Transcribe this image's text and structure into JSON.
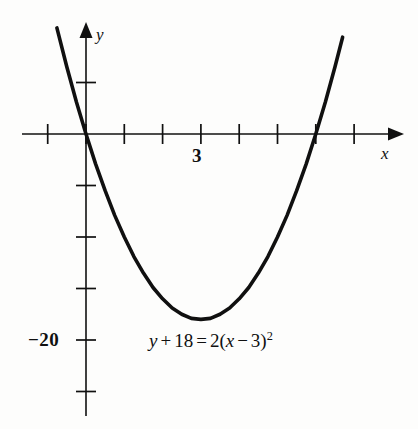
{
  "figure": {
    "background_color": "#fdfdfc",
    "ink_color": "#101010",
    "width": 418,
    "height": 429
  },
  "axes": {
    "x_axis_label": "x",
    "y_axis_label": "y",
    "x_tick_label": "3",
    "y_tick_label": "−20"
  },
  "annotation": {
    "equation_plain": "y + 18 = 2(x − 3)²",
    "parts": {
      "y": "y",
      "plus": "+",
      "eighteen": "18",
      "equals": "=",
      "two": "2",
      "open_paren": "(",
      "x": "x",
      "minus": "−",
      "three": "3",
      "close_paren": ")",
      "exponent": "2"
    }
  },
  "chart_data": {
    "type": "line",
    "title": "",
    "subtitle": "",
    "xlabel": "x",
    "ylabel": "y",
    "annotations": [
      "y + 18 = 2(x − 3)²"
    ],
    "grid": false,
    "legend": "none",
    "equation": "y = 2(x - 3)^2 - 18",
    "vertex": [
      3,
      -18
    ],
    "roots": [
      0,
      6
    ],
    "y_intercept": 0,
    "axis_of_symmetry": 3,
    "opens": "up",
    "leading_coefficient": 2,
    "xlim": [
      -1.7,
      7.6
    ],
    "ylim": [
      -27.2,
      10.8
    ],
    "x_tick_values": [
      -1,
      0,
      1,
      2,
      3,
      4,
      5,
      6,
      7
    ],
    "x_tick_labels": [
      "",
      "",
      "",
      "",
      "3",
      "",
      "",
      "",
      ""
    ],
    "y_tick_values": [
      5,
      0,
      -5,
      -10,
      -15,
      -20,
      -25
    ],
    "y_tick_labels": [
      "",
      "",
      "",
      "",
      "",
      "−20",
      ""
    ],
    "x": [
      -0.76,
      -0.5,
      -0.25,
      0,
      0.25,
      0.5,
      0.75,
      1,
      1.25,
      1.5,
      1.75,
      2,
      2.25,
      2.5,
      2.75,
      3,
      3.25,
      3.5,
      3.75,
      4,
      4.25,
      4.5,
      4.75,
      5,
      5.25,
      5.5,
      5.75,
      6,
      6.25,
      6.5,
      6.7
    ],
    "y": [
      10.3,
      6.5,
      3.1,
      0,
      -2.9,
      -5.5,
      -7.9,
      -10,
      -11.9,
      -13.5,
      -14.9,
      -16,
      -16.9,
      -17.5,
      -17.9,
      -18,
      -17.9,
      -17.5,
      -16.9,
      -16,
      -14.9,
      -13.5,
      -11.9,
      -10,
      -7.9,
      -5.5,
      -2.9,
      0,
      3.1,
      6.5,
      9.4
    ]
  }
}
